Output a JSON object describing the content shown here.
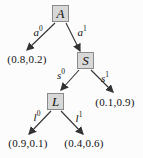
{
  "figure": {
    "type": "decision-tree",
    "colors": {
      "background": "#fcfcfc",
      "node_fill": "#d8d8d8",
      "node_border": "#8a8a8a",
      "arrow": "#333333",
      "text": "#111111"
    },
    "nodes": {
      "A": "A",
      "S": "S",
      "L": "L"
    },
    "edge_labels": {
      "a0": {
        "base": "a",
        "sup": "0"
      },
      "a1": {
        "base": "a",
        "sup": "1"
      },
      "s0": {
        "base": "s",
        "sup": "0"
      },
      "s1": {
        "base": "s",
        "sup": "1"
      },
      "l0": {
        "base": "l",
        "sup": "0"
      },
      "l1": {
        "base": "l",
        "sup": "1"
      }
    },
    "leaves": {
      "a0": "(0.8,0.2)",
      "s1": "(0.1,0.9)",
      "l0": "(0.9,0.1)",
      "l1": "(0.4,0.6)"
    }
  }
}
